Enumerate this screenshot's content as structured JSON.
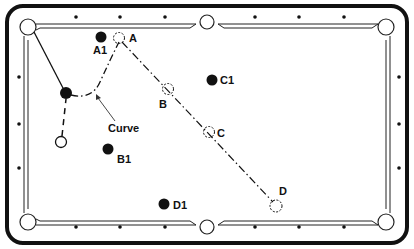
{
  "diagram": {
    "type": "pool-table-shot-diagram",
    "colors": {
      "ink": "#111111",
      "table": "#ffffff"
    },
    "labels": {
      "A": "A",
      "B": "B",
      "C": "C",
      "D": "D",
      "A1": "A1",
      "B1": "B1",
      "C1": "C1",
      "D1": "D1",
      "curve": "Curve"
    },
    "balls": [
      {
        "id": "A1",
        "kind": "object-ball",
        "x": 101,
        "y": 37
      },
      {
        "id": "C1",
        "kind": "object-ball",
        "x": 212,
        "y": 80
      },
      {
        "id": "B1",
        "kind": "object-ball",
        "x": 108,
        "y": 149
      },
      {
        "id": "D1",
        "kind": "object-ball",
        "x": 164,
        "y": 204
      },
      {
        "id": "contact",
        "kind": "object-ball",
        "x": 66,
        "y": 93
      },
      {
        "id": "cue",
        "kind": "cue-ball",
        "x": 61,
        "y": 142
      }
    ],
    "ghost_positions": [
      {
        "id": "A",
        "x": 119,
        "y": 38
      },
      {
        "id": "B",
        "x": 168,
        "y": 89
      },
      {
        "id": "C",
        "x": 209,
        "y": 132
      },
      {
        "id": "D",
        "x": 276,
        "y": 206
      }
    ],
    "annotation": {
      "text": "Curve",
      "points_to": "curved cue-ball path"
    }
  }
}
